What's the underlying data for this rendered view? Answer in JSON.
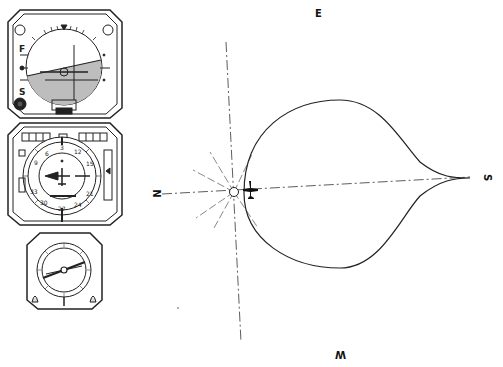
{
  "diagram": {
    "type": "teardrop-procedure-turn",
    "compass_labels": {
      "east": "E",
      "west": "W",
      "north": "N",
      "south": "S"
    },
    "instruments": [
      {
        "name": "attitude-indicator",
        "labels": {
          "top_left": "F",
          "bottom_left": "S"
        }
      },
      {
        "name": "horizontal-situation-indicator",
        "card_numbers": [
          "3",
          "6",
          "9",
          "12",
          "15",
          "21",
          "24",
          "30",
          "33",
          "27"
        ]
      },
      {
        "name": "radio-magnetic-indicator"
      }
    ],
    "colors": {
      "ink": "#222222",
      "paper": "#ffffff",
      "shade": "#bdbdbd"
    }
  }
}
